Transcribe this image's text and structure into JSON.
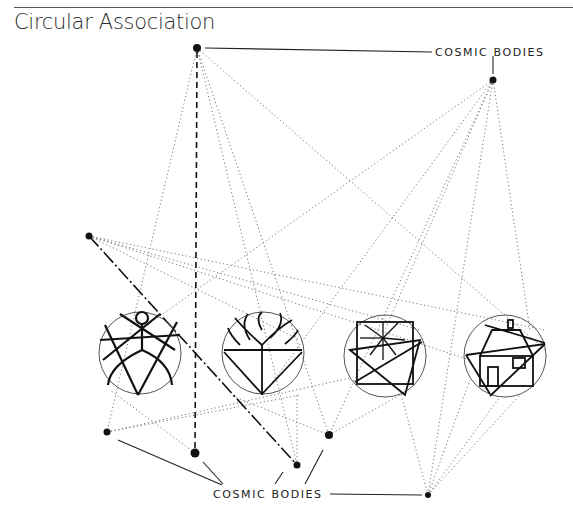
{
  "page": {
    "title": "Circular Association"
  },
  "labels": {
    "top": "COSMIC BODIES",
    "bottom": "COSMIC BODIES"
  },
  "colors": {
    "ink": "#111111",
    "dotted": "#777777",
    "circle": "#555555"
  },
  "bodies": [
    {
      "id": "top-left",
      "x": 197,
      "y": 48,
      "r": 4
    },
    {
      "id": "top-right",
      "x": 493,
      "y": 80,
      "r": 3.5
    },
    {
      "id": "mid-left",
      "x": 89,
      "y": 236,
      "r": 3.5
    },
    {
      "id": "bottom-1",
      "x": 107,
      "y": 432,
      "r": 3.5
    },
    {
      "id": "bottom-2",
      "x": 195,
      "y": 453,
      "r": 4.5
    },
    {
      "id": "bottom-3",
      "x": 297,
      "y": 465,
      "r": 3.5
    },
    {
      "id": "bottom-4",
      "x": 329,
      "y": 435,
      "r": 4
    },
    {
      "id": "bottom-5",
      "x": 428,
      "y": 495,
      "r": 3
    }
  ],
  "symbols": [
    {
      "name": "human-figure",
      "cx": 140,
      "cy": 353,
      "r": 41
    },
    {
      "name": "tree",
      "cx": 263,
      "cy": 353,
      "r": 41
    },
    {
      "name": "sun",
      "cx": 385,
      "cy": 356,
      "r": 41
    },
    {
      "name": "house",
      "cx": 505,
      "cy": 356,
      "r": 41
    }
  ]
}
